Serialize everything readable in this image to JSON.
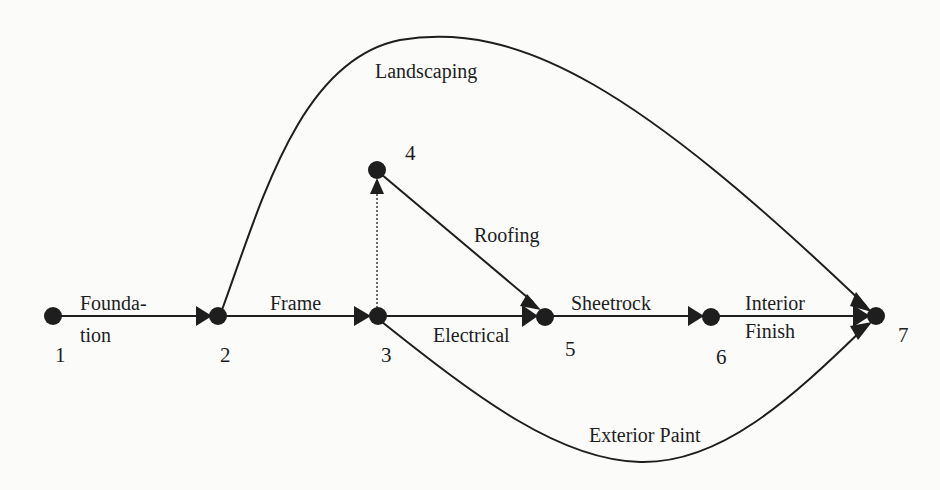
{
  "diagram": {
    "type": "activity-on-arrow network",
    "nodes": [
      {
        "id": "1",
        "label": "1"
      },
      {
        "id": "2",
        "label": "2"
      },
      {
        "id": "3",
        "label": "3"
      },
      {
        "id": "4",
        "label": "4"
      },
      {
        "id": "5",
        "label": "5"
      },
      {
        "id": "6",
        "label": "6"
      },
      {
        "id": "7",
        "label": "7"
      }
    ],
    "edges": [
      {
        "from": "1",
        "to": "2",
        "label_line1": "Founda-",
        "label_line2": "tion",
        "style": "solid"
      },
      {
        "from": "2",
        "to": "3",
        "label": "Frame",
        "style": "solid"
      },
      {
        "from": "2",
        "to": "7",
        "label": "Landscaping",
        "style": "solid-curve"
      },
      {
        "from": "3",
        "to": "4",
        "label": "",
        "style": "dotted"
      },
      {
        "from": "3",
        "to": "5",
        "label": "Electrical",
        "style": "solid"
      },
      {
        "from": "3",
        "to": "7",
        "label": "Exterior Paint",
        "style": "solid-curve"
      },
      {
        "from": "4",
        "to": "5",
        "label": "Roofing",
        "style": "solid"
      },
      {
        "from": "5",
        "to": "6",
        "label": "Sheetrock",
        "style": "solid"
      },
      {
        "from": "6",
        "to": "7",
        "label_line1": "Interior",
        "label_line2": "Finish",
        "style": "solid"
      }
    ]
  },
  "colors": {
    "ink": "#1e1e1e",
    "paper": "#fbfbfa",
    "bleed_text": "#ececec"
  }
}
